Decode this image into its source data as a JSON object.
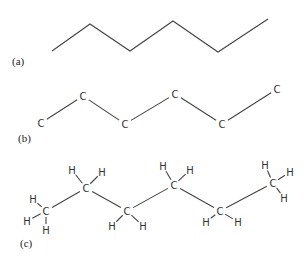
{
  "figure": {
    "panels": [
      {
        "label": "(a)",
        "type": "skeletal",
        "vertices": [
          [
            52,
            51
          ],
          [
            90,
            24
          ],
          [
            130,
            51
          ],
          [
            173,
            21
          ],
          [
            218,
            52
          ],
          [
            268,
            19
          ]
        ]
      },
      {
        "label": "(b)",
        "type": "carbon-only",
        "atom_symbol": "C",
        "atoms": [
          [
            41,
            123
          ],
          [
            83,
            96
          ],
          [
            125,
            124
          ],
          [
            175,
            94
          ],
          [
            222,
            124
          ],
          [
            277,
            89
          ]
        ]
      },
      {
        "label": "(c)",
        "type": "full",
        "carbon_symbol": "C",
        "hydrogen_symbol": "H",
        "carbons": [
          {
            "pos": [
              46,
              211
            ],
            "h": [
              [
                33,
                199
              ],
              [
                27,
                221
              ],
              [
                46,
                230
              ]
            ]
          },
          {
            "pos": [
              86,
              188
            ],
            "h": [
              [
                72,
                170
              ],
              [
                102,
                172
              ]
            ]
          },
          {
            "pos": [
              127,
              211
            ],
            "h": [
              [
                112,
                226
              ],
              [
                143,
                226
              ]
            ]
          },
          {
            "pos": [
              174,
              185
            ],
            "h": [
              [
                163,
                166
              ],
              [
                190,
                170
              ]
            ]
          },
          {
            "pos": [
              220,
              211
            ],
            "h": [
              [
                206,
                222
              ],
              [
                238,
                222
              ]
            ]
          },
          {
            "pos": [
              273,
              183
            ],
            "h": [
              [
                265,
                165
              ],
              [
                290,
                172
              ],
              [
                284,
                198
              ]
            ]
          }
        ]
      }
    ]
  }
}
